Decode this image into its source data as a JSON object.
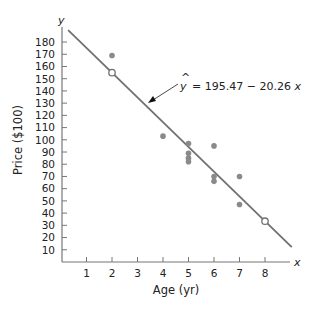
{
  "chart_data": {
    "type": "scatter",
    "title": "",
    "xlabel": "Age (yr)",
    "ylabel": "Price ($100)",
    "x_axis_var": "x",
    "y_axis_var": "y",
    "xlim": [
      0,
      9
    ],
    "ylim": [
      0,
      190
    ],
    "x_ticks": [
      1,
      2,
      3,
      4,
      5,
      6,
      7,
      8
    ],
    "y_ticks": [
      10,
      20,
      30,
      40,
      50,
      60,
      70,
      80,
      90,
      100,
      110,
      120,
      130,
      140,
      150,
      160,
      170,
      180
    ],
    "grid": false,
    "series": [
      {
        "name": "observations",
        "marker": "filled-circle",
        "color": "#8a8a8a",
        "points": [
          {
            "x": 2,
            "y": 169
          },
          {
            "x": 4,
            "y": 103
          },
          {
            "x": 5,
            "y": 97
          },
          {
            "x": 5,
            "y": 89
          },
          {
            "x": 5,
            "y": 85
          },
          {
            "x": 5,
            "y": 82
          },
          {
            "x": 6,
            "y": 95
          },
          {
            "x": 6,
            "y": 70
          },
          {
            "x": 6,
            "y": 66
          },
          {
            "x": 7,
            "y": 70
          },
          {
            "x": 7,
            "y": 47
          }
        ]
      },
      {
        "name": "regression-line-points",
        "marker": "open-circle",
        "color": "#707070",
        "points": [
          {
            "x": 2,
            "y": 154.95
          },
          {
            "x": 8,
            "y": 33.39
          }
        ]
      }
    ],
    "regression_line": {
      "intercept": 195.47,
      "slope": -20.26,
      "x_start": 0.28,
      "x_end": 9.05,
      "color": "#707070"
    },
    "annotations": [
      {
        "text_hat": "^",
        "text_var": "y",
        "text_rest": "= 195.47 − 20.26",
        "text_x_var": "x",
        "arrow_to_x": 3.46,
        "arrow_to_y": 125
      }
    ]
  },
  "labels": {
    "x_axis_title": "Age (yr)",
    "y_axis_title": "Price ($100)",
    "x_var": "x",
    "y_var": "y",
    "eq_hat": "^",
    "eq_var": "y",
    "eq_body": "= 195.47 − 20.26",
    "eq_x": "x"
  }
}
